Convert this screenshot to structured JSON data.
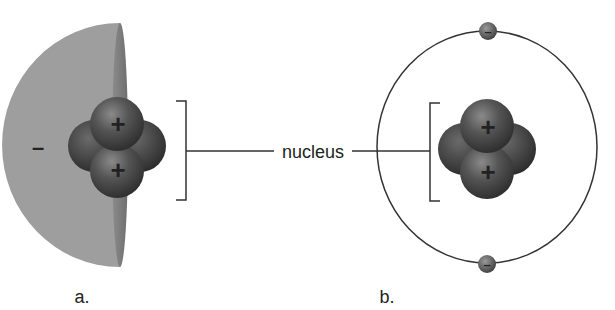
{
  "figure": {
    "center_label": "nucleus",
    "panels": [
      {
        "id": "a",
        "label": "a.",
        "electron_cloud_sign": "–",
        "protons": [
          {
            "sign": "+"
          },
          {
            "sign": "+"
          }
        ]
      },
      {
        "id": "b",
        "label": "b.",
        "protons": [
          {
            "sign": "+"
          },
          {
            "sign": "+"
          }
        ],
        "electrons": [
          {
            "sign": "–",
            "position": "top"
          },
          {
            "sign": "–",
            "position": "bottom"
          }
        ]
      }
    ]
  },
  "colors": {
    "cloud": "#9c9c9c",
    "cloud_edge": "#7e7e7e",
    "particle_dark": "#3a3a3a",
    "particle_mid": "#5a5a5a",
    "line": "#333333",
    "text": "#222222"
  }
}
